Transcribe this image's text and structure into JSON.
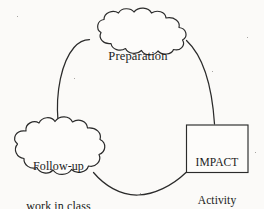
{
  "diagram": {
    "type": "cycle-diagram",
    "background_color": "#fbfaf8",
    "stroke_color": "#2b2b2b",
    "nodes": [
      {
        "id": "preparation",
        "shape": "cloud",
        "label": "Preparation",
        "lines": [
          "Preparation"
        ],
        "position": "top"
      },
      {
        "id": "impact-activity",
        "shape": "rectangle",
        "label": "IMPACT Activity at home",
        "lines": [
          "IMPACT",
          "Activity",
          "at home"
        ],
        "position": "right"
      },
      {
        "id": "follow-up",
        "shape": "cloud",
        "label": "Follow-up work in class",
        "lines": [
          "Follow-up",
          "work in class"
        ],
        "position": "left"
      }
    ],
    "connectors": [
      {
        "id": "prep-to-impact",
        "from": "preparation",
        "to": "impact-activity",
        "style": "curve"
      },
      {
        "id": "impact-to-followup",
        "from": "impact-activity",
        "to": "follow-up",
        "style": "curve"
      },
      {
        "id": "followup-to-prep",
        "from": "follow-up",
        "to": "preparation",
        "style": "curve"
      }
    ]
  }
}
